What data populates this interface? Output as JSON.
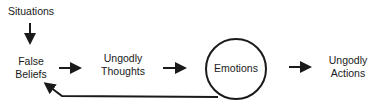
{
  "diagram": {
    "nodes": {
      "situations": {
        "label": "Situations"
      },
      "false_beliefs": {
        "line1": "False",
        "line2": "Beliefs"
      },
      "ungodly_thoughts": {
        "line1": "Ungodly",
        "line2": "Thoughts"
      },
      "emotions": {
        "label": "Emotions",
        "shape": "circle"
      },
      "ungodly_actions": {
        "line1": "Ungodly",
        "line2": "Actions"
      }
    },
    "edges": [
      {
        "from": "Situations",
        "to": "False Beliefs"
      },
      {
        "from": "False Beliefs",
        "to": "Ungodly Thoughts"
      },
      {
        "from": "Ungodly Thoughts",
        "to": "Emotions"
      },
      {
        "from": "Emotions",
        "to": "Ungodly Actions"
      },
      {
        "from": "Emotions",
        "to": "False Beliefs",
        "type": "feedback"
      }
    ],
    "colors": {
      "ink": "#1a1a1a",
      "background": "#ffffff"
    }
  }
}
